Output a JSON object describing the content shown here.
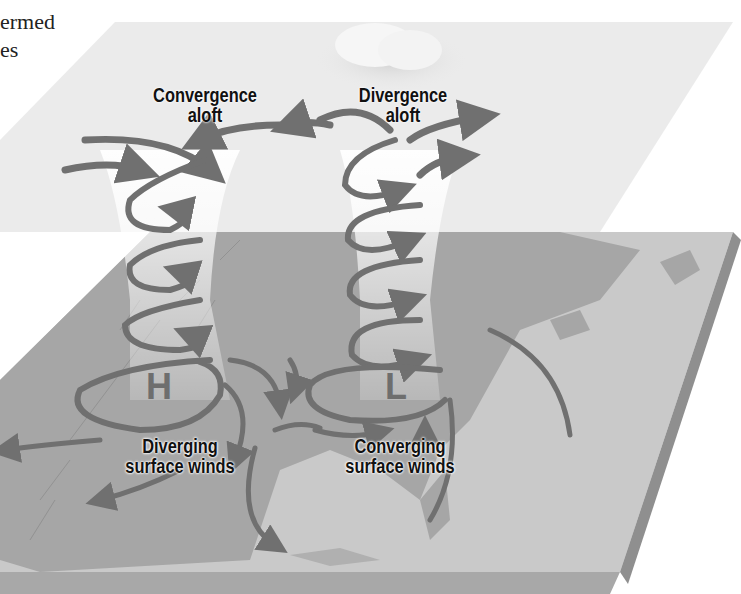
{
  "caption": {
    "line1": "ermed",
    "line2": "es"
  },
  "labels": {
    "convergence_aloft": [
      "Convergence",
      "aloft"
    ],
    "divergence_aloft": [
      "Divergence",
      "aloft"
    ],
    "diverging_surface": [
      "Diverging",
      "surface winds"
    ],
    "converging_surface": [
      "Converging",
      "surface winds"
    ]
  },
  "pressure_systems": {
    "high": "H",
    "low": "L"
  },
  "colors": {
    "upper_plane": "#e9e9e9",
    "map_land": "#a8a8a8",
    "map_water": "#dcdcdc",
    "arrow": "#707070",
    "slab_edge": "#9a9a9a",
    "text": "#111111"
  }
}
